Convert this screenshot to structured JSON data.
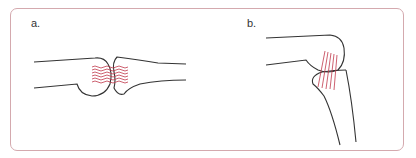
{
  "figure": {
    "panels": [
      {
        "label": "a.",
        "description": "extended joint with wavy (crimped) fibers across joint"
      },
      {
        "label": "b.",
        "description": "flexed joint with straight taut fibers across joint"
      }
    ]
  },
  "colors": {
    "frame": "#d4a9ae",
    "bone_outline": "#333333",
    "fibers": "#c0394b"
  }
}
